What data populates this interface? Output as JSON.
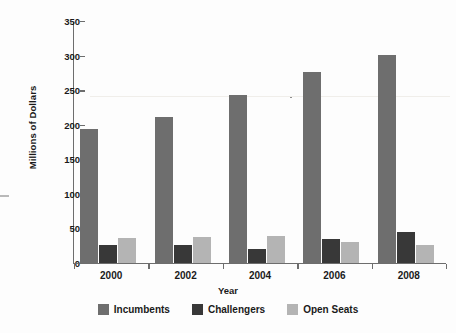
{
  "chart_data": {
    "type": "bar",
    "title": "",
    "xlabel": "Year",
    "ylabel": "Millions of Dollars",
    "categories": [
      "2000",
      "2002",
      "2004",
      "2006",
      "2008"
    ],
    "series": [
      {
        "name": "Incumbents",
        "color": "#6e6e6e",
        "values": [
          195,
          213,
          245,
          277,
          303
        ]
      },
      {
        "name": "Challengers",
        "color": "#383838",
        "values": [
          27,
          28,
          22,
          36,
          47
        ]
      },
      {
        "name": "Open Seats",
        "color": "#b4b4b4",
        "values": [
          37,
          39,
          41,
          32,
          27
        ]
      }
    ],
    "ylim": [
      0,
      350
    ],
    "yticks": [
      0,
      50,
      100,
      150,
      200,
      250,
      300,
      350
    ],
    "ytick_labels": [
      "0",
      "50",
      "100",
      "150",
      "200",
      "250",
      "300",
      "350"
    ],
    "grid": false,
    "legend_position": "bottom"
  }
}
